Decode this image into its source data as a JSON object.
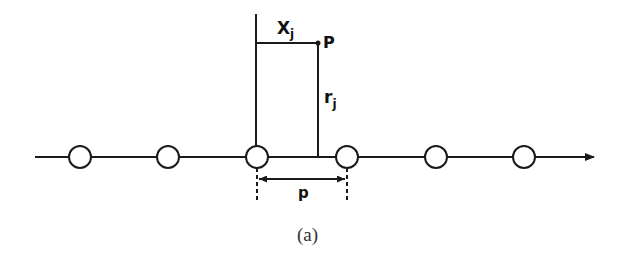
{
  "diagram": {
    "caption": "(a)",
    "labels": {
      "x_j_main": "X",
      "x_j_sub": "j",
      "point": "P",
      "r_j_main": "r",
      "r_j_sub": "j",
      "pitch": "p"
    },
    "axis": {
      "y": 157,
      "x_start": 35,
      "x_end": 594,
      "direction": "right"
    },
    "nodes": [
      {
        "cx": 80,
        "cy": 157,
        "r": 11
      },
      {
        "cx": 168,
        "cy": 157,
        "r": 11
      },
      {
        "cx": 257,
        "cy": 157,
        "r": 11
      },
      {
        "cx": 347,
        "cy": 157,
        "r": 11
      },
      {
        "cx": 436,
        "cy": 157,
        "r": 11
      },
      {
        "cx": 524,
        "cy": 157,
        "r": 11
      }
    ],
    "point_P": {
      "x": 318,
      "y": 43
    },
    "colors": {
      "stroke": "#1a1a1a",
      "background": "#ffffff"
    }
  }
}
